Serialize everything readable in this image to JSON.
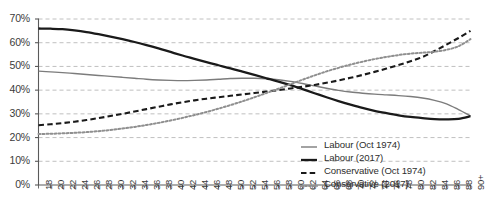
{
  "chart_data": {
    "type": "line",
    "title": "",
    "subtitle": "",
    "xlabel": "",
    "ylabel": "",
    "xlim": [
      18,
      90
    ],
    "ylim": [
      0,
      0.7
    ],
    "grid": true,
    "grid_axis": "y",
    "legend_position": "bottom-right",
    "y_tick_labels": [
      "0%",
      "10%",
      "20%",
      "30%",
      "40%",
      "50%",
      "60%",
      "70%"
    ],
    "y_tick_values": [
      0,
      0.1,
      0.2,
      0.3,
      0.4,
      0.5,
      0.6,
      0.7
    ],
    "x_tick_labels": [
      "18",
      "20",
      "22",
      "24",
      "26",
      "28",
      "30",
      "32",
      "34",
      "36",
      "38",
      "40",
      "42",
      "44",
      "46",
      "48",
      "50",
      "52",
      "54",
      "56",
      "58",
      "60",
      "62",
      "64",
      "66",
      "68",
      "70",
      "72",
      "74",
      "76",
      "78",
      "80",
      "82",
      "84",
      "86",
      "88",
      "90+"
    ],
    "x": [
      18,
      20,
      22,
      24,
      26,
      28,
      30,
      32,
      34,
      36,
      38,
      40,
      42,
      44,
      46,
      48,
      50,
      52,
      54,
      56,
      58,
      60,
      62,
      64,
      66,
      68,
      70,
      72,
      74,
      76,
      78,
      80,
      82,
      84,
      86,
      88,
      90
    ],
    "series": [
      {
        "name": "Labour (Oct 1974)",
        "color": "#7c7c7c",
        "style": "solid",
        "width": 1.4,
        "values": [
          0.48,
          0.477,
          0.474,
          0.47,
          0.466,
          0.462,
          0.458,
          0.454,
          0.45,
          0.446,
          0.443,
          0.441,
          0.44,
          0.441,
          0.443,
          0.446,
          0.449,
          0.45,
          0.45,
          0.448,
          0.444,
          0.437,
          0.428,
          0.418,
          0.408,
          0.399,
          0.392,
          0.387,
          0.383,
          0.38,
          0.377,
          0.373,
          0.367,
          0.357,
          0.342,
          0.318,
          0.292
        ]
      },
      {
        "name": "Labour (2017)",
        "color": "#1a1a1a",
        "style": "solid",
        "width": 2.3,
        "values": [
          0.66,
          0.659,
          0.657,
          0.652,
          0.645,
          0.636,
          0.626,
          0.615,
          0.603,
          0.59,
          0.576,
          0.561,
          0.546,
          0.532,
          0.518,
          0.505,
          0.492,
          0.478,
          0.464,
          0.45,
          0.436,
          0.421,
          0.404,
          0.387,
          0.37,
          0.354,
          0.339,
          0.325,
          0.313,
          0.303,
          0.294,
          0.287,
          0.282,
          0.278,
          0.277,
          0.279,
          0.29
        ]
      },
      {
        "name": "Conservative (Oct 1974)",
        "color": "#1a1a1a",
        "style": "dashed",
        "width": 2.1,
        "values": [
          0.252,
          0.256,
          0.261,
          0.267,
          0.274,
          0.282,
          0.291,
          0.3,
          0.31,
          0.32,
          0.33,
          0.34,
          0.349,
          0.357,
          0.364,
          0.37,
          0.376,
          0.382,
          0.388,
          0.394,
          0.4,
          0.407,
          0.414,
          0.422,
          0.431,
          0.441,
          0.452,
          0.464,
          0.477,
          0.491,
          0.506,
          0.522,
          0.54,
          0.565,
          0.592,
          0.62,
          0.65
        ]
      },
      {
        "name": "Conservative (2017)",
        "color": "#8f8f8f",
        "style": "dotted",
        "width": 2.0,
        "values": [
          0.215,
          0.216,
          0.218,
          0.22,
          0.223,
          0.227,
          0.232,
          0.238,
          0.245,
          0.253,
          0.262,
          0.272,
          0.283,
          0.295,
          0.308,
          0.322,
          0.337,
          0.353,
          0.37,
          0.388,
          0.406,
          0.425,
          0.444,
          0.462,
          0.479,
          0.494,
          0.508,
          0.52,
          0.531,
          0.54,
          0.548,
          0.554,
          0.558,
          0.562,
          0.57,
          0.585,
          0.615
        ]
      }
    ]
  },
  "legend": {
    "items": [
      {
        "label": "Labour (Oct 1974)"
      },
      {
        "label": "Labour (2017)"
      },
      {
        "label": "Conservative (Oct 1974)"
      },
      {
        "label": "Conservative (2017)"
      }
    ]
  }
}
